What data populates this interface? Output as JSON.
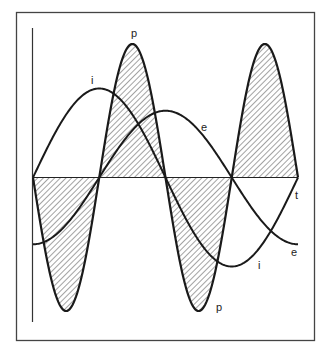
{
  "chart_data": {
    "type": "line",
    "title": "",
    "xlabel": "t",
    "ylabel": "",
    "grid": false,
    "legend": null,
    "series": [
      {
        "name": "i",
        "label": "i",
        "amplitude": 1.0,
        "phase_deg": 0,
        "frequency": 1
      },
      {
        "name": "e",
        "label": "e",
        "amplitude": 0.75,
        "phase_deg": -90,
        "frequency": 1
      },
      {
        "name": "p",
        "label": "p",
        "amplitude": 1.5,
        "frequency": 2,
        "hatched": true
      }
    ],
    "x_range_cycles": [
      0,
      1
    ],
    "p_zero_crossings_fraction": [
      0,
      0.25,
      0.5,
      0.75,
      1.0
    ]
  },
  "labels": {
    "p_top": "p",
    "p_bottom": "p",
    "i_top": "i",
    "i_bottom": "i",
    "e_top": "e",
    "e_bottom": "e",
    "t_axis": "t"
  },
  "colors": {
    "stroke": "#1a1a1a",
    "frame": "#444444",
    "hatch": "#555555",
    "background": "#ffffff"
  }
}
